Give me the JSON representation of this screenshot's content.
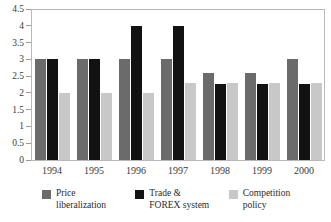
{
  "chart_data": {
    "type": "bar",
    "title": "",
    "subtitle": "",
    "xlabel": "",
    "ylabel": "",
    "categories": [
      "1994",
      "1995",
      "1996",
      "1997",
      "1998",
      "1999",
      "2000"
    ],
    "series": [
      {
        "name": "Price liberalization",
        "color": "#6b6b6b",
        "legend_line1": "Price",
        "legend_line2": "liberalization",
        "values": [
          3,
          3,
          3,
          3,
          2.6,
          2.6,
          3
        ]
      },
      {
        "name": "Trade & FOREX system",
        "color": "#121212",
        "legend_line1": "Trade &",
        "legend_line2": "FOREX system",
        "values": [
          3,
          3,
          4,
          4,
          2.27,
          2.27,
          2.27
        ]
      },
      {
        "name": "Competition policy",
        "color": "#c8c8c8",
        "legend_line1": "Competition",
        "legend_line2": "policy",
        "values": [
          2,
          2,
          2,
          2.3,
          2.3,
          2.3,
          2.3
        ]
      }
    ],
    "ylim": [
      0,
      4.5
    ],
    "yticks": [
      "0",
      "0.5",
      "1",
      "1.5",
      "2",
      "2.5",
      "3",
      "3.5",
      "4",
      "4.5"
    ],
    "ytick_values": [
      0,
      0.5,
      1,
      1.5,
      2,
      2.5,
      3,
      3.5,
      4,
      4.5
    ],
    "grid": false,
    "legend_position": "bottom",
    "frame_color": "#b9b9b9",
    "tick_color": "#9a9a9a"
  }
}
